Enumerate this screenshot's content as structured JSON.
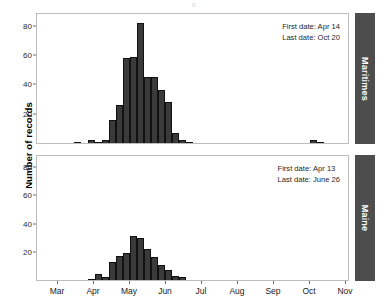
{
  "figure": {
    "ylabel": "Number of records",
    "top_fragment": "e"
  },
  "panels": [
    {
      "key": "maritimes",
      "strip_label": "Maritimes",
      "annotation": {
        "first_date": "First date: Apr 14",
        "last_date": "Last date: Oct 20"
      },
      "yticks": [
        20,
        40,
        60,
        80
      ],
      "ylim": [
        0,
        88
      ]
    },
    {
      "key": "maine",
      "strip_label": "Maine",
      "annotation": {
        "first_date": "First date: Apr 13",
        "last_date": "Last date: June 26"
      },
      "yticks": [
        20,
        40,
        60,
        80
      ],
      "ylim": [
        0,
        88
      ]
    }
  ],
  "xaxis": {
    "ticks": [
      "Mar",
      "Apr",
      "May",
      "Jun",
      "Jul",
      "Aug",
      "Sep",
      "Oct",
      "Nov"
    ],
    "tick_positions": [
      57,
      93,
      129,
      165,
      201,
      237,
      273,
      309,
      345
    ]
  },
  "colors": {
    "bar_fill": "#3a3a3a",
    "bar_outline": "#111111",
    "strip_fill": "#4d4d4d",
    "strip_text": "#ffffff",
    "panel_border": "#bdbdbd",
    "background": "#ffffff"
  },
  "chart_data": {
    "type": "bar",
    "title": "",
    "xlabel": "",
    "ylabel": "Number of records",
    "ylim": [
      0,
      88
    ],
    "grid": false,
    "legend": "none",
    "bin_width_px": 7.3,
    "x_tick_labels": [
      "Mar",
      "Apr",
      "May",
      "Jun",
      "Jul",
      "Aug",
      "Sep",
      "Oct",
      "Nov"
    ],
    "note": "Two stacked histogram panels of weekly record counts by date; x-axis spans Feb through Nov.",
    "panels": [
      {
        "name": "Maritimes",
        "first_date": "Apr 14",
        "last_date": "Oct 20",
        "bins": [
          {
            "x_px": 60,
            "value": 0
          },
          {
            "x_px": 67,
            "value": 0
          },
          {
            "x_px": 74,
            "value": 1
          },
          {
            "x_px": 81,
            "value": 0
          },
          {
            "x_px": 88,
            "value": 2
          },
          {
            "x_px": 95,
            "value": 1
          },
          {
            "x_px": 102,
            "value": 2
          },
          {
            "x_px": 109,
            "value": 16
          },
          {
            "x_px": 116,
            "value": 26
          },
          {
            "x_px": 123,
            "value": 58
          },
          {
            "x_px": 130,
            "value": 59
          },
          {
            "x_px": 137,
            "value": 82
          },
          {
            "x_px": 144,
            "value": 45
          },
          {
            "x_px": 151,
            "value": 45
          },
          {
            "x_px": 158,
            "value": 36
          },
          {
            "x_px": 165,
            "value": 28
          },
          {
            "x_px": 172,
            "value": 7
          },
          {
            "x_px": 179,
            "value": 2
          },
          {
            "x_px": 186,
            "value": 1
          },
          {
            "x_px": 310,
            "value": 2
          },
          {
            "x_px": 317,
            "value": 1
          }
        ]
      },
      {
        "name": "Maine",
        "first_date": "Apr 13",
        "last_date": "June 26",
        "bins": [
          {
            "x_px": 88,
            "value": 1
          },
          {
            "x_px": 95,
            "value": 4
          },
          {
            "x_px": 102,
            "value": 2
          },
          {
            "x_px": 109,
            "value": 13
          },
          {
            "x_px": 116,
            "value": 17
          },
          {
            "x_px": 123,
            "value": 19
          },
          {
            "x_px": 130,
            "value": 31
          },
          {
            "x_px": 137,
            "value": 30
          },
          {
            "x_px": 144,
            "value": 22
          },
          {
            "x_px": 151,
            "value": 16
          },
          {
            "x_px": 158,
            "value": 11
          },
          {
            "x_px": 165,
            "value": 7
          },
          {
            "x_px": 172,
            "value": 3
          },
          {
            "x_px": 179,
            "value": 2
          }
        ]
      }
    ]
  }
}
